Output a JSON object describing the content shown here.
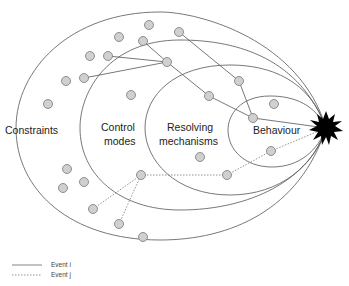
{
  "diagram": {
    "type": "nested-ellipses-event-diagram",
    "layers": [
      {
        "name": "constraints",
        "label": "Constraints"
      },
      {
        "name": "control-modes",
        "label_line1": "Control",
        "label_line2": "modes"
      },
      {
        "name": "resolving-mechanisms",
        "label_line1": "Resolving",
        "label_line2": "mechanisms"
      },
      {
        "name": "behaviour",
        "label": "Behaviour"
      }
    ],
    "outcome": {
      "name": "event-starburst",
      "x": 326,
      "y": 128
    },
    "node_color": "#d0d0d0",
    "node_stroke": "#777777",
    "line_color": "#555555",
    "event_i_path": [
      [
        131,
        95
      ],
      [
        84,
        78
      ]
    ],
    "legend": {
      "event_i_label": "Event i",
      "event_j_label": "Event j"
    }
  }
}
